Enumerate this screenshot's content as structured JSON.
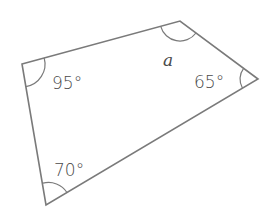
{
  "diagram": {
    "type": "quadrilateral",
    "stroke_color": "#7a7a7a",
    "text_color": "#4a4a4a",
    "vertices": [
      {
        "name": "top-left",
        "x": 22,
        "y": 64
      },
      {
        "name": "top-right",
        "x": 180,
        "y": 21
      },
      {
        "name": "right",
        "x": 258,
        "y": 79
      },
      {
        "name": "bottom-left",
        "x": 46,
        "y": 205
      }
    ],
    "angles": {
      "top_left": "95°",
      "top_right": "a",
      "right": "65°",
      "bottom_left": "70°"
    }
  }
}
